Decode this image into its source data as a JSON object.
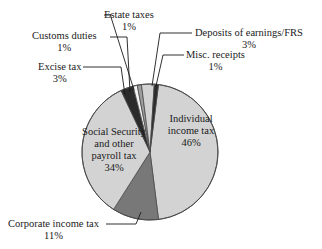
{
  "chart_data": {
    "type": "pie",
    "title": "",
    "subtitle": "",
    "legend_position": "callout-labels",
    "grid": false,
    "categories": [
      "Individual income tax",
      "Corporate income tax",
      "Social Security and other payroll tax",
      "Excise tax",
      "Customs duties",
      "Estate taxes",
      "Deposits of earnings/FRS",
      "Misc. receipts"
    ],
    "values": [
      46,
      11,
      34,
      3,
      1,
      1,
      3,
      1
    ],
    "unit": "percent",
    "slices": [
      {
        "label": "Individual income tax",
        "value": 46,
        "pct_text": "46%",
        "color": "#d3d3d3",
        "label_placement": "inside",
        "start_deg": 7.2,
        "sweep_deg": 165.6
      },
      {
        "label": "Corporate income tax",
        "value": 11,
        "pct_text": "11%",
        "color": "#787878",
        "label_placement": "outside",
        "start_deg": 172.8,
        "sweep_deg": 39.6
      },
      {
        "label": "Social Security and other payroll tax",
        "value": 34,
        "pct_text": "34%",
        "color": "#d3d3d3",
        "label_placement": "inside",
        "start_deg": 212.4,
        "sweep_deg": 122.4
      },
      {
        "label": "Excise tax",
        "value": 3,
        "pct_text": "3%",
        "color": "#2b2b2b",
        "label_placement": "outside",
        "start_deg": 334.8,
        "sweep_deg": 10.8
      },
      {
        "label": "Customs duties",
        "value": 1,
        "pct_text": "1%",
        "color": "#f2f2f2",
        "label_placement": "outside",
        "start_deg": 345.6,
        "sweep_deg": 3.6
      },
      {
        "label": "Estate taxes",
        "value": 1,
        "pct_text": "1%",
        "color": "#9e9e9e",
        "label_placement": "outside",
        "start_deg": 349.2,
        "sweep_deg": 3.6
      },
      {
        "label": "Deposits of earnings/FRS",
        "value": 3,
        "pct_text": "3%",
        "color": "#d3d3d3",
        "label_placement": "outside",
        "start_deg": 352.8,
        "sweep_deg": 10.8
      },
      {
        "label": "Misc. receipts",
        "value": 1,
        "pct_text": "1%",
        "color": "#2b2b2b",
        "label_placement": "outside",
        "start_deg": 363.6,
        "sweep_deg": 3.6
      }
    ],
    "colors": {
      "light_gray": "#d3d3d3",
      "mid_gray": "#787878",
      "dark_gray": "#2b2b2b",
      "near_white": "#f2f2f2",
      "outline": "#4a4a4a",
      "background": "#ffffff",
      "text": "#1a1a1a"
    }
  },
  "labels": {
    "estate": {
      "name": "Estate taxes",
      "pct": "1%"
    },
    "customs": {
      "name": "Customs duties",
      "pct": "1%"
    },
    "excise": {
      "name": "Excise tax",
      "pct": "3%"
    },
    "deposits": {
      "name": "Deposits of earnings/FRS",
      "pct": "3%"
    },
    "misc": {
      "name": "Misc. receipts",
      "pct": "1%"
    },
    "corporate": {
      "name": "Corporate income tax",
      "pct": "11%"
    },
    "individual": {
      "line1": "Individual",
      "line2": "income tax",
      "pct": "46%"
    },
    "social": {
      "line1": "Social Security",
      "line2": "and other",
      "line3": "payroll tax",
      "pct": "34%"
    }
  }
}
